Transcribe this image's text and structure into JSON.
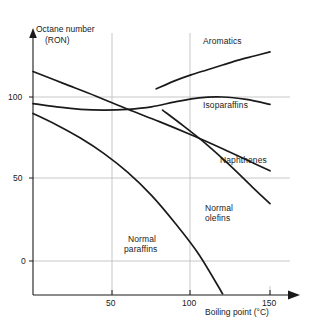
{
  "chart_data": {
    "type": "line",
    "title": "",
    "xlabel": "Boiling point (°C)",
    "ylabel": "Octane number (RON)",
    "ylabel_line1": "Octane number",
    "ylabel_line2": "(RON)",
    "xlim": [
      0,
      160
    ],
    "ylim": [
      -25,
      135
    ],
    "xticks": [
      50,
      100,
      150
    ],
    "xticklabels": [
      "50",
      "100",
      "150"
    ],
    "yticks": [
      0,
      50,
      100
    ],
    "yticklabels": [
      "0",
      "50",
      "100"
    ],
    "grid": true,
    "grid_color": "#b9b9b9",
    "line_color": "#1a1a1a",
    "legend": "inline-annotations",
    "series": [
      {
        "name": "Aromatics",
        "label": "Aromatics",
        "label_x": 108,
        "label_y": 124,
        "x": [
          78,
          90,
          100,
          110,
          120,
          130,
          140,
          150
        ],
        "y": [
          105,
          110,
          113.5,
          116.5,
          119.5,
          122.5,
          125,
          127.5
        ]
      },
      {
        "name": "Isoparaffins",
        "label": "Isoparaffins",
        "label_x": 108,
        "label_y": 88,
        "x": [
          0,
          15,
          30,
          45,
          60,
          75,
          90,
          105,
          120,
          135,
          150
        ],
        "y": [
          96,
          94,
          92.5,
          92,
          92.5,
          94,
          97,
          99.5,
          100,
          98.5,
          95.5
        ]
      },
      {
        "name": "Naphthenes",
        "label": "Naphthenes",
        "label_x": 118,
        "label_y": 43,
        "x": [
          0,
          20,
          40,
          60,
          80,
          100,
          120,
          140,
          150
        ],
        "y": [
          115.5,
          108,
          100.5,
          92.5,
          85,
          77,
          68.5,
          59.5,
          55
        ]
      },
      {
        "name": "Normal olefins",
        "label": "Normal olefins",
        "label_line1": "Normal",
        "label_line2": "olefins",
        "label_x": 112,
        "label_y": 5,
        "x": [
          82,
          95,
          110,
          125,
          140,
          150
        ],
        "y": [
          92,
          82.5,
          71,
          58,
          44,
          35
        ]
      },
      {
        "name": "Normal paraffins",
        "label": "Normal paraffins",
        "label_line1": "Normal",
        "label_line2": "paraffins",
        "label_x": 58,
        "label_y": -10,
        "x": [
          0,
          15,
          30,
          45,
          60,
          75,
          90,
          105,
          120
        ],
        "y": [
          90,
          83,
          75,
          65.5,
          54,
          40,
          23,
          4,
          -20
        ]
      }
    ]
  }
}
